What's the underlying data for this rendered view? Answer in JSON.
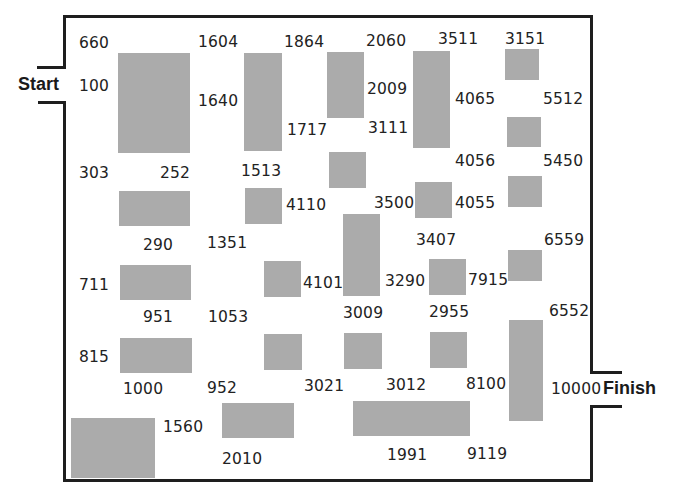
{
  "labels": {
    "start": "Start",
    "finish": "Finish"
  },
  "colors": {
    "block": "#ababab",
    "wall": "#1e1e1e",
    "background": "#ffffff",
    "text": "#222222"
  },
  "numbers": [
    {
      "value": "660",
      "x": 79,
      "y": 34
    },
    {
      "value": "1604",
      "x": 198,
      "y": 33
    },
    {
      "value": "1864",
      "x": 284,
      "y": 33
    },
    {
      "value": "2060",
      "x": 366,
      "y": 32
    },
    {
      "value": "3511",
      "x": 438,
      "y": 30
    },
    {
      "value": "3151",
      "x": 505,
      "y": 30
    },
    {
      "value": "100",
      "x": 79,
      "y": 77
    },
    {
      "value": "1640",
      "x": 198,
      "y": 92
    },
    {
      "value": "2009",
      "x": 367,
      "y": 80
    },
    {
      "value": "4065",
      "x": 455,
      "y": 90
    },
    {
      "value": "5512",
      "x": 543,
      "y": 90
    },
    {
      "value": "1717",
      "x": 287,
      "y": 121
    },
    {
      "value": "3111",
      "x": 368,
      "y": 119
    },
    {
      "value": "4056",
      "x": 455,
      "y": 152
    },
    {
      "value": "5450",
      "x": 543,
      "y": 152
    },
    {
      "value": "303",
      "x": 79,
      "y": 164
    },
    {
      "value": "252",
      "x": 160,
      "y": 164
    },
    {
      "value": "1513",
      "x": 241,
      "y": 162
    },
    {
      "value": "4110",
      "x": 286,
      "y": 196
    },
    {
      "value": "3500",
      "x": 374,
      "y": 194
    },
    {
      "value": "4055",
      "x": 455,
      "y": 194
    },
    {
      "value": "290",
      "x": 143,
      "y": 236
    },
    {
      "value": "1351",
      "x": 207,
      "y": 234
    },
    {
      "value": "3407",
      "x": 416,
      "y": 231
    },
    {
      "value": "6559",
      "x": 544,
      "y": 231
    },
    {
      "value": "711",
      "x": 79,
      "y": 276
    },
    {
      "value": "4101",
      "x": 303,
      "y": 274
    },
    {
      "value": "3290",
      "x": 385,
      "y": 272
    },
    {
      "value": "7915",
      "x": 468,
      "y": 271
    },
    {
      "value": "951",
      "x": 143,
      "y": 308
    },
    {
      "value": "1053",
      "x": 208,
      "y": 308
    },
    {
      "value": "3009",
      "x": 343,
      "y": 304
    },
    {
      "value": "2955",
      "x": 429,
      "y": 303
    },
    {
      "value": "6552",
      "x": 549,
      "y": 302
    },
    {
      "value": "815",
      "x": 79,
      "y": 348
    },
    {
      "value": "1000",
      "x": 123,
      "y": 380
    },
    {
      "value": "952",
      "x": 207,
      "y": 379
    },
    {
      "value": "3021",
      "x": 304,
      "y": 377
    },
    {
      "value": "3012",
      "x": 386,
      "y": 376
    },
    {
      "value": "8100",
      "x": 466,
      "y": 375
    },
    {
      "value": "10000",
      "x": 551,
      "y": 380
    },
    {
      "value": "1560",
      "x": 163,
      "y": 418
    },
    {
      "value": "2010",
      "x": 222,
      "y": 450
    },
    {
      "value": "1991",
      "x": 387,
      "y": 446
    },
    {
      "value": "9119",
      "x": 467,
      "y": 445
    }
  ],
  "blocks": [
    {
      "x": 118,
      "y": 53,
      "w": 72,
      "h": 100
    },
    {
      "x": 244,
      "y": 53,
      "w": 38,
      "h": 98
    },
    {
      "x": 327,
      "y": 52,
      "w": 37,
      "h": 66
    },
    {
      "x": 413,
      "y": 51,
      "w": 37,
      "h": 97
    },
    {
      "x": 505,
      "y": 49,
      "w": 34,
      "h": 31
    },
    {
      "x": 507,
      "y": 117,
      "w": 34,
      "h": 30
    },
    {
      "x": 329,
      "y": 152,
      "w": 37,
      "h": 36
    },
    {
      "x": 119,
      "y": 191,
      "w": 71,
      "h": 35
    },
    {
      "x": 245,
      "y": 188,
      "w": 37,
      "h": 36
    },
    {
      "x": 415,
      "y": 182,
      "w": 37,
      "h": 36
    },
    {
      "x": 508,
      "y": 176,
      "w": 34,
      "h": 31
    },
    {
      "x": 343,
      "y": 214,
      "w": 37,
      "h": 82
    },
    {
      "x": 264,
      "y": 261,
      "w": 37,
      "h": 36
    },
    {
      "x": 429,
      "y": 259,
      "w": 37,
      "h": 36
    },
    {
      "x": 508,
      "y": 250,
      "w": 34,
      "h": 31
    },
    {
      "x": 120,
      "y": 265,
      "w": 71,
      "h": 35
    },
    {
      "x": 120,
      "y": 338,
      "w": 72,
      "h": 35
    },
    {
      "x": 264,
      "y": 334,
      "w": 38,
      "h": 36
    },
    {
      "x": 344,
      "y": 333,
      "w": 38,
      "h": 36
    },
    {
      "x": 430,
      "y": 332,
      "w": 37,
      "h": 36
    },
    {
      "x": 509,
      "y": 320,
      "w": 34,
      "h": 101
    },
    {
      "x": 71,
      "y": 418,
      "w": 84,
      "h": 60
    },
    {
      "x": 222,
      "y": 403,
      "w": 72,
      "h": 35
    },
    {
      "x": 353,
      "y": 401,
      "w": 117,
      "h": 35
    }
  ]
}
